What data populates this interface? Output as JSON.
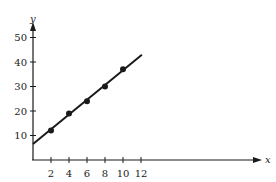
{
  "chart_data": {
    "type": "scatter",
    "title": "",
    "xlabel": "x",
    "ylabel": "y",
    "xlim": [
      0,
      12.5
    ],
    "ylim": [
      0,
      53
    ],
    "grid": false,
    "legend": null,
    "x_ticks": [
      2,
      4,
      6,
      8,
      10,
      12
    ],
    "y_ticks": [
      10,
      20,
      30,
      40,
      50
    ],
    "series": [
      {
        "name": "data points",
        "type": "scatter",
        "x": [
          2,
          4,
          6,
          8,
          10
        ],
        "y": [
          12,
          19,
          24,
          30,
          37
        ]
      },
      {
        "name": "fitted line",
        "type": "line",
        "x": [
          0,
          12.1
        ],
        "y": [
          6.5,
          43
        ]
      }
    ],
    "colors": {
      "ink": "#1a1a1a",
      "background": "#ffffff"
    }
  },
  "axes": {
    "x_label": "x",
    "y_label": "y",
    "x_tick_labels": [
      "2",
      "4",
      "6",
      "8",
      "10",
      "12"
    ],
    "y_tick_labels": [
      "10",
      "20",
      "30",
      "40",
      "50"
    ]
  }
}
